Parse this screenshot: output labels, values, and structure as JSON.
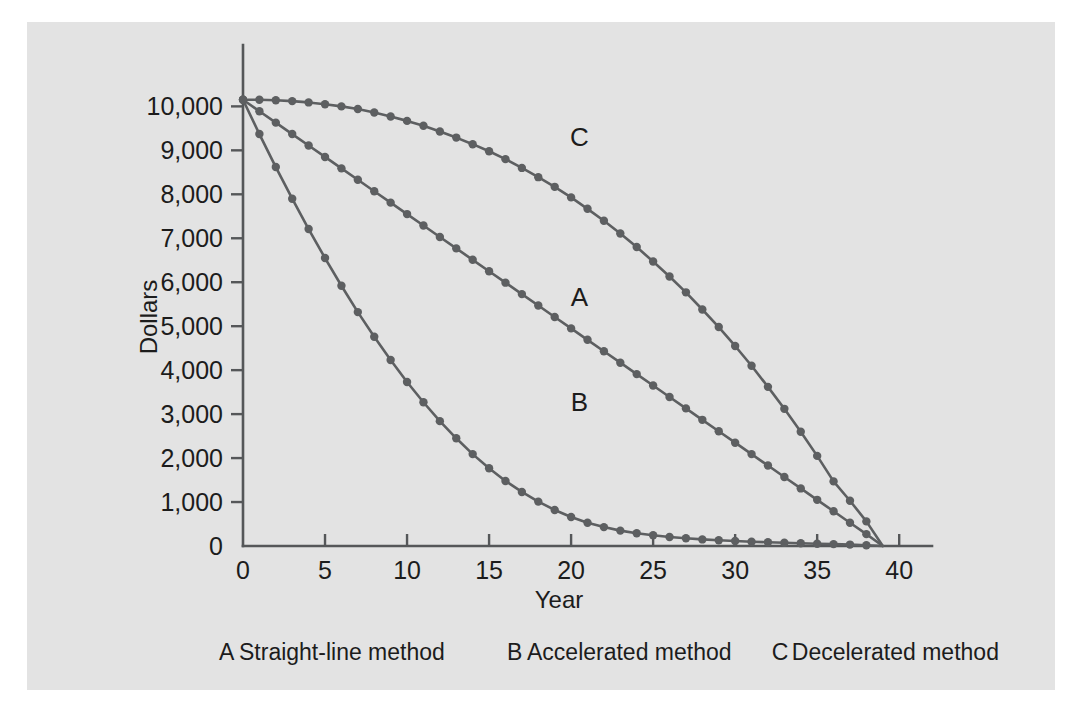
{
  "figure": {
    "background_color": "#e3e3e3",
    "page_color": "#ffffff",
    "ink_color": "#555759"
  },
  "chart_data": {
    "type": "line",
    "title": "",
    "subtitle": "",
    "xlabel": "Year",
    "ylabel": "Dollars",
    "xlim": [
      0,
      42
    ],
    "ylim": [
      0,
      10600
    ],
    "grid": false,
    "legend_position": "bottom",
    "xticks": [
      0,
      5,
      10,
      15,
      20,
      25,
      30,
      35,
      40
    ],
    "xtick_labels": [
      "0",
      "5",
      "10",
      "15",
      "20",
      "25",
      "30",
      "35",
      "40"
    ],
    "yticks": [
      0,
      1000,
      2000,
      3000,
      4000,
      5000,
      6000,
      7000,
      8000,
      9000,
      10000
    ],
    "ytick_labels": [
      "0",
      "1,000",
      "2,000",
      "3,000",
      "4,000",
      "5,000",
      "6,000",
      "7,000",
      "8,000",
      "9,000",
      "10,000"
    ],
    "annotations": [
      {
        "text": "A",
        "x": 20.5,
        "y": 5450
      },
      {
        "text": "B",
        "x": 20.5,
        "y": 3060
      },
      {
        "text": "C",
        "x": 20.5,
        "y": 9100
      }
    ],
    "x": [
      0,
      1,
      2,
      3,
      4,
      5,
      6,
      7,
      8,
      9,
      10,
      11,
      12,
      13,
      14,
      15,
      16,
      17,
      18,
      19,
      20,
      21,
      22,
      23,
      24,
      25,
      26,
      27,
      28,
      29,
      30,
      31,
      32,
      33,
      34,
      35,
      36,
      37,
      38,
      39
    ],
    "series": [
      {
        "name": "A",
        "label": "Straight-line method",
        "values": [
          10150,
          9890,
          9630,
          9370,
          9110,
          8850,
          8590,
          8330,
          8070,
          7810,
          7550,
          7290,
          7030,
          6770,
          6510,
          6250,
          5990,
          5730,
          5470,
          5210,
          4950,
          4690,
          4430,
          4170,
          3910,
          3650,
          3390,
          3130,
          2870,
          2610,
          2350,
          2090,
          1830,
          1570,
          1310,
          1050,
          790,
          530,
          270,
          0
        ]
      },
      {
        "name": "B",
        "label": "Accelerated method",
        "values": [
          10150,
          9370,
          8620,
          7900,
          7210,
          6550,
          5920,
          5320,
          4760,
          4230,
          3730,
          3270,
          2840,
          2450,
          2090,
          1770,
          1480,
          1230,
          1010,
          820,
          660,
          530,
          430,
          350,
          290,
          245,
          205,
          175,
          150,
          130,
          113,
          98,
          85,
          73,
          62,
          52,
          42,
          32,
          18,
          0
        ]
      },
      {
        "name": "C",
        "label": "Decelerated method",
        "values": [
          10150,
          10150,
          10140,
          10120,
          10090,
          10050,
          10000,
          9940,
          9860,
          9770,
          9670,
          9560,
          9430,
          9290,
          9140,
          8980,
          8800,
          8600,
          8390,
          8170,
          7930,
          7670,
          7400,
          7110,
          6800,
          6470,
          6130,
          5770,
          5380,
          4980,
          4550,
          4100,
          3620,
          3120,
          2600,
          2050,
          1470,
          1030,
          560,
          0
        ]
      }
    ]
  },
  "legend": {
    "entries": [
      {
        "key": "A",
        "label": "Straight-line method"
      },
      {
        "key": "B",
        "label": "Accelerated method"
      },
      {
        "key": "C",
        "label": "Decelerated method"
      }
    ]
  }
}
